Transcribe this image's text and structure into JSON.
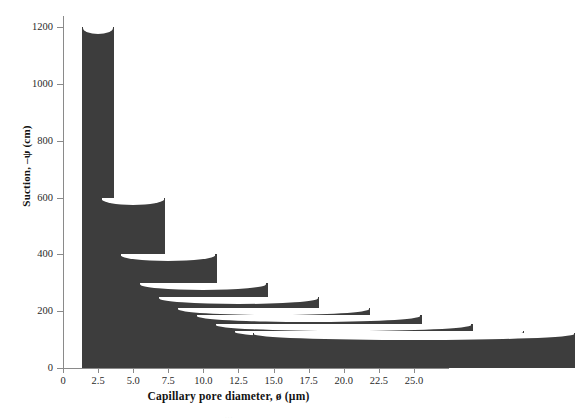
{
  "chart_data": {
    "type": "bar",
    "title": "",
    "xlabel": "Capillary pore diameter, ø (µm)",
    "ylabel": "Suction, –ψ (cm)",
    "categories": [
      "2.5",
      "5.0",
      "7.5",
      "10.0",
      "12.5",
      "15.0",
      "17.5",
      "20.0",
      "22.5",
      "25.0"
    ],
    "x": [
      2.5,
      5.0,
      7.5,
      10.0,
      12.5,
      15.0,
      17.5,
      20.0,
      22.5,
      25.0
    ],
    "values": [
      1200,
      600,
      400,
      300,
      250,
      210,
      185,
      155,
      130,
      125
    ],
    "xlim": [
      0,
      26.5
    ],
    "ylim": [
      0,
      1240
    ],
    "xticks": [
      0,
      2.5,
      5.0,
      7.5,
      10.0,
      12.5,
      15.0,
      17.5,
      20.0,
      22.5,
      25.0
    ],
    "xtick_labels": [
      "0",
      "2.5",
      "5.0",
      "7.5",
      "10.0",
      "12.5",
      "15.0",
      "17.5",
      "20.0",
      "22.5",
      "25.0"
    ],
    "yticks": [
      0,
      200,
      400,
      600,
      800,
      1000,
      1200
    ],
    "ytick_labels": [
      "0",
      "200",
      "400",
      "600",
      "800",
      "1000",
      "1200"
    ],
    "grid": false,
    "legend": null,
    "bar_color": "#3d3d3d",
    "axis_color": "#8a8a8a",
    "background": "#ffffff",
    "bar_width_mode": "proportional-to-pore-diameter",
    "bar_style": "capillary-tube-with-meniscus"
  },
  "caption": {
    "text": "..."
  }
}
